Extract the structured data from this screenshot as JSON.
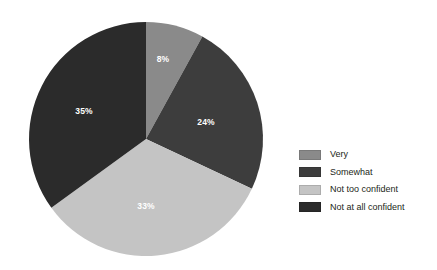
{
  "chart_data": {
    "type": "pie",
    "title": "",
    "subtitle": "",
    "xlabel": "",
    "ylabel": "",
    "grid": false,
    "legend_position": "right",
    "start_angle_deg": 0,
    "direction": "clockwise",
    "categories": [
      "Very",
      "Somewhat",
      "Not too confident",
      "Not at all confident"
    ],
    "values": [
      8,
      24,
      33,
      35
    ],
    "value_unit": "%",
    "colors": [
      "#8a8a8a",
      "#3d3d3d",
      "#c4c4c4",
      "#2b2b2b"
    ],
    "slices": [
      {
        "label": "Very",
        "value": 8,
        "value_text": "8%",
        "color": "#8a8a8a",
        "label_color": "#ffffff",
        "label_x": 163,
        "label_y": 60
      },
      {
        "label": "Somewhat",
        "value": 24,
        "value_text": "24%",
        "color": "#3d3d3d",
        "label_color": "#ffffff",
        "label_x": 206,
        "label_y": 123
      },
      {
        "label": "Not too confident",
        "value": 33,
        "value_text": "33%",
        "color": "#c4c4c4",
        "label_color": "#ffffff",
        "label_x": 146,
        "label_y": 207
      },
      {
        "label": "Not at all confident",
        "value": 35,
        "value_text": "35%",
        "color": "#2b2b2b",
        "label_color": "#ffffff",
        "label_x": 84,
        "label_y": 112
      }
    ],
    "geometry": {
      "center_x": 146,
      "center_y": 139,
      "radius": 117
    }
  },
  "legend": {
    "items": [
      {
        "label": "Very",
        "color": "#8a8a8a"
      },
      {
        "label": "Somewhat",
        "color": "#3d3d3d"
      },
      {
        "label": "Not too confident",
        "color": "#c4c4c4"
      },
      {
        "label": "Not at all confident",
        "color": "#2b2b2b"
      }
    ]
  }
}
